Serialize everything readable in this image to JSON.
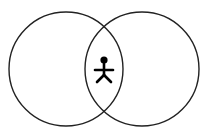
{
  "diagram": {
    "type": "venn",
    "background": "#ffffff",
    "stroke_color": "#222222",
    "circles": [
      {
        "id": "left",
        "cx": 66,
        "cy": 69,
        "r": 57
      },
      {
        "id": "right",
        "cx": 142,
        "cy": 69,
        "r": 57
      }
    ],
    "intersection_icon": {
      "name": "stick-figure-icon",
      "color": "#000000",
      "cx": 104,
      "cy": 63
    }
  }
}
